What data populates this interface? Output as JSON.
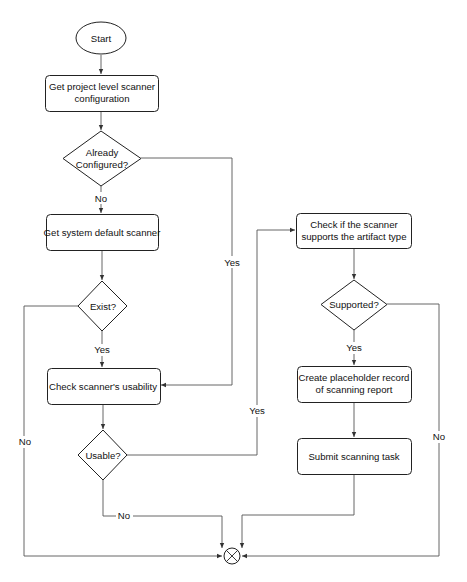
{
  "diagram": {
    "type": "flowchart",
    "nodes": {
      "start": {
        "shape": "ellipse",
        "label": "Start"
      },
      "get_project_config": {
        "shape": "rounded-rect",
        "line1": "Get project level scanner",
        "line2": "configuration"
      },
      "already_configured": {
        "shape": "diamond",
        "line1": "Already",
        "line2": "Configured?"
      },
      "get_system_default": {
        "shape": "rounded-rect",
        "label": "Get system default scanner"
      },
      "exist": {
        "shape": "diamond",
        "label": "Exist?"
      },
      "check_usability": {
        "shape": "rounded-rect",
        "label": "Check scanner's usability"
      },
      "usable": {
        "shape": "diamond",
        "label": "Usable?"
      },
      "check_artifact_support": {
        "shape": "rounded-rect",
        "line1": "Check if the scanner",
        "line2": "supports the artifact type"
      },
      "supported": {
        "shape": "diamond",
        "label": "Supported?"
      },
      "create_placeholder": {
        "shape": "rounded-rect",
        "line1": "Create placeholder record",
        "line2": "of scanning report"
      },
      "submit_task": {
        "shape": "rounded-rect",
        "label": "Submit scanning task"
      },
      "end_merge": {
        "shape": "circle-x",
        "label": ""
      }
    },
    "edges": [
      {
        "from": "start",
        "to": "get_project_config",
        "label": ""
      },
      {
        "from": "get_project_config",
        "to": "already_configured",
        "label": ""
      },
      {
        "from": "already_configured",
        "to": "get_system_default",
        "label": "No"
      },
      {
        "from": "already_configured",
        "to": "check_usability",
        "label": "Yes"
      },
      {
        "from": "get_system_default",
        "to": "exist",
        "label": ""
      },
      {
        "from": "exist",
        "to": "check_usability",
        "label": "Yes"
      },
      {
        "from": "exist",
        "to": "end_merge",
        "label": "No"
      },
      {
        "from": "check_usability",
        "to": "usable",
        "label": ""
      },
      {
        "from": "usable",
        "to": "check_artifact_support",
        "label": "Yes"
      },
      {
        "from": "usable",
        "to": "end_merge",
        "label": "No"
      },
      {
        "from": "check_artifact_support",
        "to": "supported",
        "label": ""
      },
      {
        "from": "supported",
        "to": "create_placeholder",
        "label": "Yes"
      },
      {
        "from": "supported",
        "to": "end_merge",
        "label": "No"
      },
      {
        "from": "create_placeholder",
        "to": "submit_task",
        "label": ""
      },
      {
        "from": "submit_task",
        "to": "end_merge",
        "label": ""
      }
    ],
    "edge_labels": {
      "configured_no": "No",
      "configured_yes": "Yes",
      "exist_yes": "Yes",
      "exist_no": "No",
      "usable_yes": "Yes",
      "usable_no": "No",
      "supported_yes": "Yes",
      "supported_no": "No"
    }
  },
  "colors": {
    "stroke": "#222222",
    "edge": "#555555",
    "background": "#ffffff"
  }
}
